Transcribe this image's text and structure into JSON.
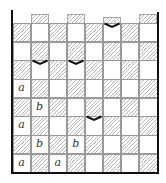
{
  "diagram": {
    "type": "tiling-board",
    "columns": 8,
    "rows": 8,
    "pattern": "checkerboard-hatched",
    "colors": {
      "hatch": "#b8b8b8",
      "grid_line": "#9a9a9a",
      "wall": "#111111",
      "background": "#ffffff"
    },
    "top_partial_tiles_columns": [
      2,
      4,
      6,
      8
    ],
    "hatched_rule": "row odd: cols 1,3,5,7; row even: cols 2,4,6,8 (rows numbered from top)",
    "labels": [
      {
        "row": 4,
        "col": 1,
        "text": "a"
      },
      {
        "row": 5,
        "col": 2,
        "text": "b"
      },
      {
        "row": 6,
        "col": 1,
        "text": "a"
      },
      {
        "row": 7,
        "col": 2,
        "text": "b"
      },
      {
        "row": 7,
        "col": 4,
        "text": "b"
      },
      {
        "row": 8,
        "col": 1,
        "text": "a"
      },
      {
        "row": 8,
        "col": 3,
        "text": "a"
      }
    ],
    "chevrons": [
      {
        "row": 1,
        "col": 6,
        "position": "top-edge"
      },
      {
        "row": 3,
        "col": 2,
        "position": "top-edge"
      },
      {
        "row": 3,
        "col": 4,
        "position": "top-edge"
      },
      {
        "row": 6,
        "col": 5,
        "position": "top-edge"
      }
    ]
  }
}
